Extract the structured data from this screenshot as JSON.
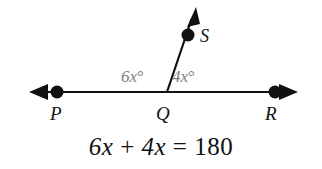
{
  "figure": {
    "type": "geometry-diagram",
    "background_color": "#ffffff",
    "stroke_color": "#111111",
    "angle_label_color": "#7d7d7d",
    "points": [
      {
        "name": "P",
        "label": "P",
        "x": 57,
        "y": 92,
        "dot": true
      },
      {
        "name": "Q",
        "label": "Q",
        "x": 167,
        "y": 92,
        "dot": false
      },
      {
        "name": "R",
        "label": "R",
        "x": 275,
        "y": 92,
        "dot": true
      },
      {
        "name": "S",
        "label": "S",
        "x": 188,
        "y": 35,
        "dot": true
      }
    ],
    "line": {
      "name": "line-PR",
      "y": 92,
      "left_tip_x": 30,
      "right_tip_x": 297,
      "double_arrow": true
    },
    "ray": {
      "name": "ray-QS",
      "from": "Q",
      "through": "S",
      "tip_x": 196,
      "tip_y": 8,
      "arrow": true
    },
    "angles": [
      {
        "name": "angle-PQS",
        "label": "6x",
        "degree_symbol": "°",
        "position": "left"
      },
      {
        "name": "angle-SQR",
        "label": "4x",
        "degree_symbol": "°",
        "position": "right"
      }
    ],
    "equation": {
      "text": "6x + 4x = 180",
      "left_term_1": "6x",
      "operator": "+",
      "left_term_2": "4x",
      "equals": "=",
      "right_side": "180"
    }
  }
}
